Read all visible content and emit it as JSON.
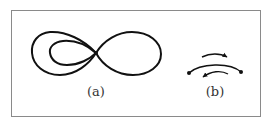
{
  "figure": {
    "panels": [
      {
        "id": "a",
        "caption": "(a)",
        "description": "Figure-eight curve: two outer lobes joined at a central node, with a smaller inner loop nested inside the left lobe"
      },
      {
        "id": "b",
        "caption": "(b)",
        "description": "An arc joining two endpoint dots, with a curved arrow above pointing right and a curved arrow below pointing left"
      }
    ]
  },
  "colors": {
    "stroke": "#111111",
    "frame": "#8a8a8a",
    "caption": "#333333",
    "background": "#ffffff"
  }
}
